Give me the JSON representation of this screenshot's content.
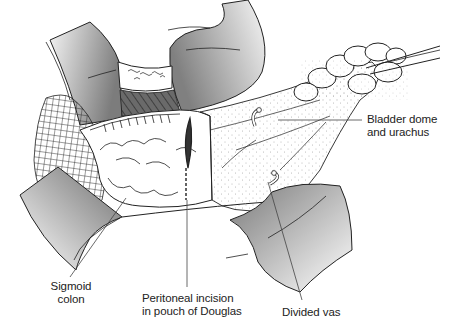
{
  "figure": {
    "labels": {
      "bladder": {
        "line1": "Bladder dome",
        "line2": "and urachus"
      },
      "sigmoid": {
        "line1": "Sigmoid",
        "line2": "colon"
      },
      "incision": {
        "line1": "Peritoneal incision",
        "line2": "in pouch of Douglas"
      },
      "vas": {
        "line1": "Divided vas"
      }
    },
    "colors": {
      "line": "#222222",
      "retractor_dark": "#7a7a7a",
      "retractor_light": "#f2f2f2",
      "hatch": "#555555",
      "background": "#ffffff"
    }
  }
}
